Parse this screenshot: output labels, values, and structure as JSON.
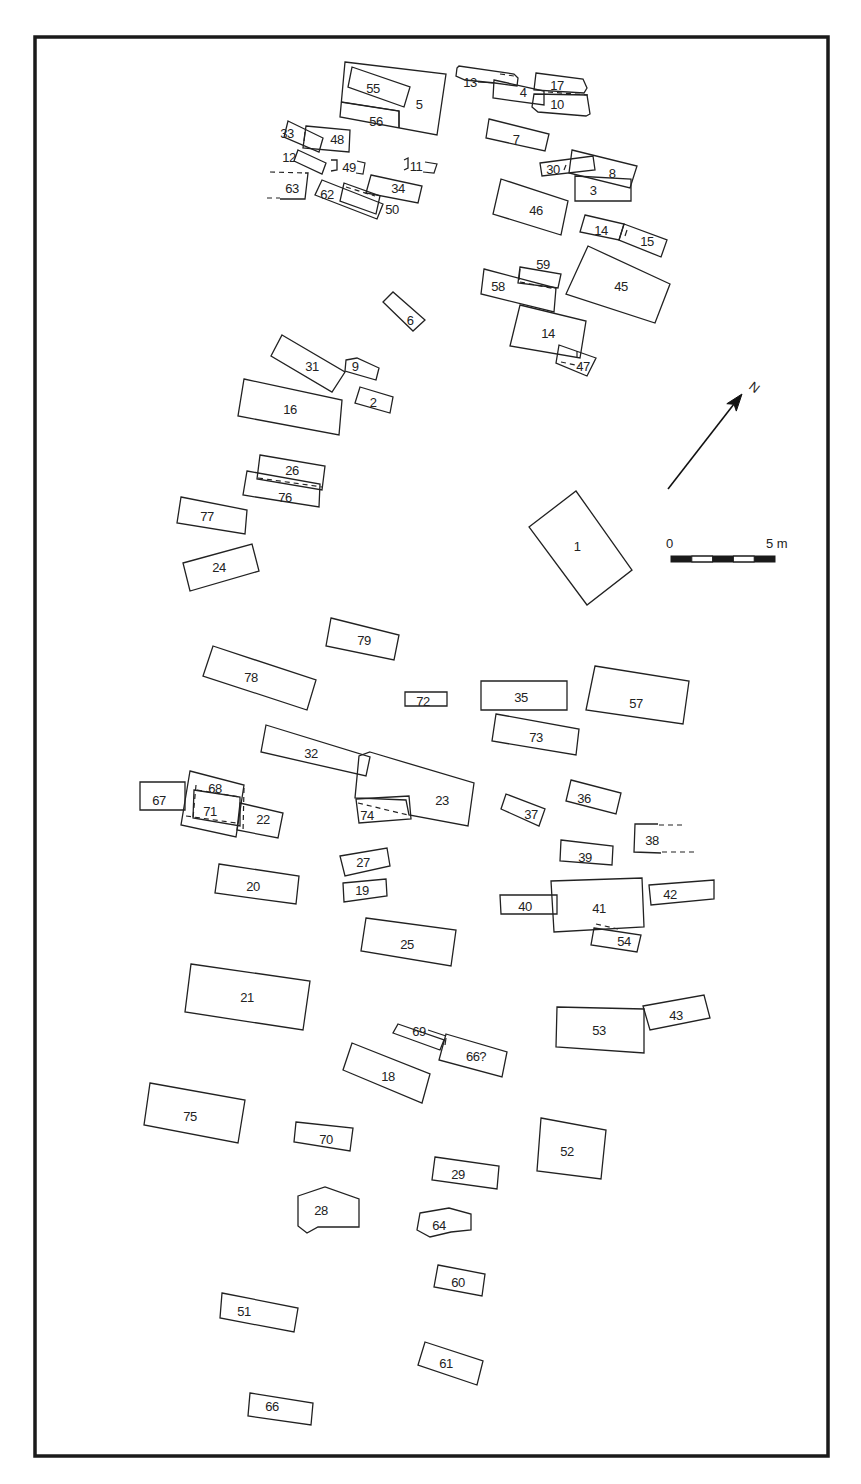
{
  "plan": {
    "frame": {
      "x": 35,
      "y": 37,
      "w": 793,
      "h": 1419
    },
    "north_arrow": {
      "label": "N",
      "x1": 668,
      "y1": 489,
      "x2": 742,
      "y2": 394,
      "label_x": 748,
      "label_y": 388
    },
    "scale_bar": {
      "start_label": "0",
      "end_label": "5 m",
      "x": 671,
      "y": 556,
      "w": 104,
      "h": 6,
      "start_label_x": 666,
      "start_label_y": 548,
      "end_label_x": 766,
      "end_label_y": 548,
      "segments": [
        "dark",
        "light",
        "dark",
        "light",
        "dark"
      ]
    },
    "features": [
      {
        "id": "1",
        "label": "1",
        "points": "529,527 576,491 632,570 587,605",
        "lx": 577,
        "ly": 546
      },
      {
        "id": "2",
        "label": "2",
        "points": "360,387 393,397 390,413 355,403",
        "lx": 373,
        "ly": 402
      },
      {
        "id": "3",
        "label": "3",
        "points": "575,176 631,179 631,201 575,201",
        "lx": 593,
        "ly": 190
      },
      {
        "id": "4",
        "label": "4",
        "points": "494,80 544,91 544,105 493,98",
        "lx": 523,
        "ly": 92
      },
      {
        "id": "5",
        "label": "5",
        "points": "345,62 446,74 437,135 340,117",
        "lx": 419,
        "ly": 104
      },
      {
        "id": "6",
        "label": "6",
        "points": "383,302 393,292 425,320 413,331",
        "lx": 410,
        "ly": 320
      },
      {
        "id": "7",
        "label": "7",
        "points": "489,119 549,134 545,151 486,138",
        "lx": 516,
        "ly": 139
      },
      {
        "id": "8",
        "label": "8",
        "points": "572,150 637,166 630,188 569,173",
        "lx": 612,
        "ly": 173
      },
      {
        "id": "9",
        "label": "9",
        "points": "346,360 357,358 379,368 376,380 345,371",
        "lx": 355,
        "ly": 366
      },
      {
        "id": "10",
        "label": "10",
        "points": "534,94 587,95 590,114 586,116 538,112 532,107",
        "lx": 557,
        "ly": 104
      },
      {
        "id": "11",
        "label": "11",
        "points": "404,160 408,158 408,168 404,170",
        "lx": 416,
        "ly": 166
      },
      {
        "id": "12",
        "label": "12",
        "points": "298,150 326,163 322,174 294,161",
        "lx": 289,
        "ly": 157
      },
      {
        "id": "13",
        "label": "13",
        "points": "457,68 459,66 514,74 518,78 517,86 495,83 465,80 456,76",
        "lx": 470,
        "ly": 82
      },
      {
        "id": "14a",
        "label": "14",
        "points": "585,215 624,224 619,240 580,232",
        "lx": 601,
        "ly": 230
      },
      {
        "id": "15",
        "label": "15",
        "points": "624,224 667,240 661,257 619,240",
        "lx": 647,
        "ly": 241
      },
      {
        "id": "14b",
        "label": "14",
        "points": "520,305 586,321 580,358 510,346",
        "lx": 548,
        "ly": 333
      },
      {
        "id": "16",
        "label": "16",
        "points": "244,379 342,400 339,435 238,416",
        "lx": 290,
        "ly": 409
      },
      {
        "id": "17",
        "label": "17",
        "points": "536,73 583,79 587,88 584,93 534,90",
        "lx": 557,
        "ly": 85
      },
      {
        "id": "18",
        "label": "18",
        "points": "352,1043 430,1074 422,1103 343,1070",
        "lx": 388,
        "ly": 1076
      },
      {
        "id": "19",
        "label": "19",
        "points": "343,883 386,879 387,896 344,902",
        "lx": 362,
        "ly": 890
      },
      {
        "id": "20",
        "label": "20",
        "points": "219,864 299,876 296,904 215,893",
        "lx": 253,
        "ly": 886
      },
      {
        "id": "21",
        "label": "21",
        "points": "191,964 310,981 303,1030 185,1012",
        "lx": 247,
        "ly": 997
      },
      {
        "id": "22",
        "label": "22",
        "points": "240,803 283,813 278,838 237,830",
        "lx": 263,
        "ly": 819
      },
      {
        "id": "23",
        "label": "23",
        "points": "370,752 474,783 468,826 409,815 406,800 355,798 359,756",
        "lx": 442,
        "ly": 800
      },
      {
        "id": "24",
        "label": "24",
        "points": "183,563 252,544 259,571 190,591",
        "lx": 219,
        "ly": 567
      },
      {
        "id": "25",
        "label": "25",
        "points": "366,918 456,930 451,966 361,951",
        "lx": 407,
        "ly": 944
      },
      {
        "id": "26",
        "label": "26",
        "points": "260,455 325,466 322,490 257,479",
        "lx": 292,
        "ly": 470
      },
      {
        "id": "27",
        "label": "27",
        "points": "340,856 387,848 390,866 345,876",
        "lx": 363,
        "ly": 862
      },
      {
        "id": "28",
        "label": "28",
        "points": "298,1196 325,1187 359,1199 359,1227 318,1227 307,1233 298,1226",
        "lx": 321,
        "ly": 1210
      },
      {
        "id": "29",
        "label": "29",
        "points": "435,1157 499,1166 497,1189 432,1180",
        "lx": 458,
        "ly": 1174
      },
      {
        "id": "30",
        "label": "30",
        "points": "540,163 593,156 595,170 542,176",
        "lx": 553,
        "ly": 169
      },
      {
        "id": "31",
        "label": "31",
        "points": "282,335 345,372 332,392 271,356",
        "lx": 312,
        "ly": 366
      },
      {
        "id": "32",
        "label": "32",
        "points": "266,725 370,757 366,776 261,752",
        "lx": 311,
        "ly": 753
      },
      {
        "id": "33",
        "label": "33",
        "points": "288,121 323,138 319,152 284,137",
        "lx": 287,
        "ly": 133
      },
      {
        "id": "34",
        "label": "34",
        "points": "371,175 422,186 418,203 366,193",
        "lx": 398,
        "ly": 188
      },
      {
        "id": "35",
        "label": "35",
        "points": "481,681 567,681 567,710 481,710",
        "lx": 521,
        "ly": 697
      },
      {
        "id": "36",
        "label": "36",
        "points": "571,780 621,793 616,814 566,801",
        "lx": 584,
        "ly": 798
      },
      {
        "id": "37",
        "label": "37",
        "points": "506,794 545,809 539,826 501,809",
        "lx": 531,
        "ly": 814
      },
      {
        "id": "38",
        "label": "38",
        "points": "658,824 635,824 634,852 661,853",
        "lx": 652,
        "ly": 840,
        "open_right": true
      },
      {
        "id": "39",
        "label": "39",
        "points": "561,840 613,846 612,865 560,861",
        "lx": 585,
        "ly": 857
      },
      {
        "id": "40",
        "label": "40",
        "points": "500,895 557,895 557,914 501,914",
        "lx": 525,
        "ly": 906
      },
      {
        "id": "41",
        "label": "41",
        "points": "551,881 642,878 644,927 554,932",
        "lx": 599,
        "ly": 908
      },
      {
        "id": "42",
        "label": "42",
        "points": "649,885 714,880 714,899 651,905",
        "lx": 670,
        "ly": 894
      },
      {
        "id": "43",
        "label": "43",
        "points": "643,1006 704,995 710,1018 650,1030",
        "lx": 676,
        "ly": 1015
      },
      {
        "id": "45",
        "label": "45",
        "points": "588,246 670,284 655,323 566,294",
        "lx": 621,
        "ly": 286
      },
      {
        "id": "46",
        "label": "46",
        "points": "501,179 568,201 561,235 493,214",
        "lx": 536,
        "ly": 210
      },
      {
        "id": "47",
        "label": "47",
        "points": "559,345 596,358 587,376 556,363",
        "lx": 583,
        "ly": 366
      },
      {
        "id": "48",
        "label": "48",
        "points": "306,126 350,130 349,152 303,148",
        "lx": 337,
        "ly": 139
      },
      {
        "id": "49",
        "label": "49",
        "points": "331,160 337,160 337,170 331,171",
        "lx": 349,
        "ly": 167
      },
      {
        "id": "50",
        "label": "50",
        "points": "344,183 380,196 376,214 340,201",
        "lx": 392,
        "ly": 209
      },
      {
        "id": "51",
        "label": "51",
        "points": "222,1293 298,1308 294,1332 220,1318",
        "lx": 244,
        "ly": 1311
      },
      {
        "id": "52",
        "label": "52",
        "points": "541,1118 606,1130 601,1179 537,1171",
        "lx": 567,
        "ly": 1151
      },
      {
        "id": "53",
        "label": "53",
        "points": "557,1007 644,1009 644,1053 556,1047",
        "lx": 599,
        "ly": 1030
      },
      {
        "id": "54",
        "label": "54",
        "points": "594,928 641,935 637,952 591,945",
        "lx": 624,
        "ly": 941
      },
      {
        "id": "55",
        "label": "55",
        "points": "352,67 410,87 404,107 348,87",
        "lx": 373,
        "ly": 88
      },
      {
        "id": "56",
        "label": "56",
        "points": "341,102 399,111 399,128",
        "lx": 376,
        "ly": 121
      },
      {
        "id": "57",
        "label": "57",
        "points": "595,666 689,681 683,724 586,710",
        "lx": 636,
        "ly": 703
      },
      {
        "id": "58",
        "label": "58",
        "points": "484,269 556,288 554,312 481,294",
        "lx": 498,
        "ly": 286
      },
      {
        "id": "59",
        "label": "59",
        "points": "520,267 561,274 558,288 518,283",
        "lx": 543,
        "ly": 264
      },
      {
        "id": "60",
        "label": "60",
        "points": "438,1265 485,1274 482,1296 434,1287",
        "lx": 458,
        "ly": 1282
      },
      {
        "id": "61",
        "label": "61",
        "points": "425,1342 483,1361 477,1385 418,1365",
        "lx": 446,
        "ly": 1363
      },
      {
        "id": "62",
        "label": "62",
        "points": "322,180 383,204 377,219 315,195",
        "lx": 327,
        "ly": 194
      },
      {
        "id": "63",
        "label": "63",
        "points": "305,173 308,173 305,199 280,199",
        "lx": 292,
        "ly": 188
      },
      {
        "id": "64",
        "label": "64",
        "points": "420,1213 449,1208 471,1214 471,1230 451,1232 430,1237 417,1230",
        "lx": 439,
        "ly": 1225
      },
      {
        "id": "66q",
        "label": "66?",
        "points": "446,1034 507,1052 502,1077 439,1060",
        "lx": 476,
        "ly": 1056
      },
      {
        "id": "66",
        "label": "66",
        "points": "250,1393 313,1403 311,1425 248,1416",
        "lx": 272,
        "ly": 1406
      },
      {
        "id": "67",
        "label": "67",
        "points": "140,782 185,782 185,810 140,810",
        "lx": 159,
        "ly": 800
      },
      {
        "id": "68",
        "label": "68",
        "points": "190,771 244,785 236,837 181,825",
        "lx": 215,
        "ly": 788
      },
      {
        "id": "69",
        "label": "69",
        "points": "398,1024 444,1040 440,1050 393,1033",
        "lx": 419,
        "ly": 1031
      },
      {
        "id": "70",
        "label": "70",
        "points": "296,1122 353,1128 350,1151 294,1142",
        "lx": 326,
        "ly": 1139
      },
      {
        "id": "71",
        "label": "71",
        "points": "194,790 240,797 240,826 193,818",
        "lx": 210,
        "ly": 811
      },
      {
        "id": "72",
        "label": "72",
        "points": "405,692 447,692 447,706 405,706",
        "lx": 423,
        "ly": 701
      },
      {
        "id": "73",
        "label": "73",
        "points": "496,714 579,729 576,755 492,741",
        "lx": 536,
        "ly": 737
      },
      {
        "id": "74",
        "label": "74",
        "points": "356,799 409,796 411,819 359,823",
        "lx": 367,
        "ly": 815
      },
      {
        "id": "75",
        "label": "75",
        "points": "150,1083 245,1100 238,1143 144,1125",
        "lx": 190,
        "ly": 1116
      },
      {
        "id": "76",
        "label": "76",
        "points": "247,471 320,484 319,507 243,495",
        "lx": 285,
        "ly": 497
      },
      {
        "id": "77",
        "label": "77",
        "points": "181,497 247,510 245,534 177,523",
        "lx": 207,
        "ly": 516
      },
      {
        "id": "78",
        "label": "78",
        "points": "213,646 316,680 307,710 203,676",
        "lx": 251,
        "ly": 677
      },
      {
        "id": "79",
        "label": "79",
        "points": "331,618 399,635 394,660 326,646",
        "lx": 364,
        "ly": 640
      }
    ],
    "dashed_lines": [
      {
        "name": "63-top-extension",
        "d": "M270,172 L305,173"
      },
      {
        "name": "63-bottom-extension",
        "d": "M267,198 L280,198"
      },
      {
        "name": "62-50-overlap",
        "d": "M346,187 L375,196"
      },
      {
        "name": "13-end",
        "d": "M500,74 L514,76"
      },
      {
        "name": "17-10-overlap",
        "d": "M548,92 L588,95"
      },
      {
        "name": "58-59-overlap",
        "d": "M520,282 L556,289"
      },
      {
        "name": "47-inner",
        "d": "M561,362 L580,366"
      },
      {
        "name": "26-76-overlap",
        "d": "M258,478 L322,487"
      },
      {
        "name": "68-71-top",
        "d": "M197,790 L240,797"
      },
      {
        "name": "68-71-left",
        "d": "M196,785 L193,818"
      },
      {
        "name": "68-71-bottom",
        "d": "M186,816 L236,823"
      },
      {
        "name": "71-22-right",
        "d": "M244,788 L243,833"
      },
      {
        "name": "74-23-overlap",
        "d": "M358,803 L408,815"
      },
      {
        "name": "38-top-extension",
        "d": "M659,825 L684,825"
      },
      {
        "name": "38-bottom-extension",
        "d": "M662,852 L694,852"
      },
      {
        "name": "41-54-overlap",
        "d": "M596,924 L618,929"
      }
    ],
    "solid_lines": [
      {
        "name": "56-divider",
        "d": "M341,102 L399,111 L399,128"
      },
      {
        "name": "13-4-leader",
        "d": "M478,82 L494,83"
      },
      {
        "name": "33-inner-tick",
        "d": "M305,132 L304,141"
      },
      {
        "name": "49-bracket-right",
        "d": "M357,161 L365,163 L363,174 L356,173"
      },
      {
        "name": "11-bracket-right",
        "d": "M425,162 L437,164 L434,173 L423,172"
      },
      {
        "name": "30-inner-tick",
        "d": "M566,165 L564,170"
      },
      {
        "name": "14-15-tick",
        "d": "M627,230 L625,236"
      },
      {
        "name": "59-58-tick",
        "d": "M520,269 L519,280"
      },
      {
        "name": "47-tick",
        "d": "M577,351 L577,357"
      },
      {
        "name": "66q-tick",
        "d": "M446,1038 L445,1045"
      },
      {
        "name": "69-leader",
        "d": "M428,1030 L446,1036"
      }
    ]
  }
}
